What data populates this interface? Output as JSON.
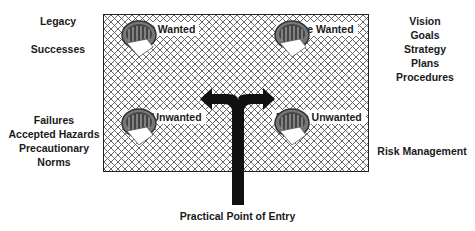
{
  "diagram": {
    "left_labels_top": [
      "Legacy",
      "Successes"
    ],
    "left_labels_bottom": [
      "Failures",
      "Accepted Hazards",
      "Precautionary",
      "Norms"
    ],
    "right_labels_top": [
      "Vision",
      "Goals",
      "Strategy",
      "Plans",
      "Procedures"
    ],
    "right_labels_bottom": [
      "Risk Management"
    ],
    "quadrants": {
      "top_left": "Past Wanted",
      "top_right": "Future Wanted",
      "bottom_left": "Past Unwanted",
      "bottom_right": "Future Unwanted"
    },
    "entry_label": "Practical Point of Entry",
    "icon_semantic": "archive-box-with-paper-icon",
    "colors": {
      "ink": "#111111",
      "hatch": "#555555",
      "background": "#ffffff"
    }
  }
}
